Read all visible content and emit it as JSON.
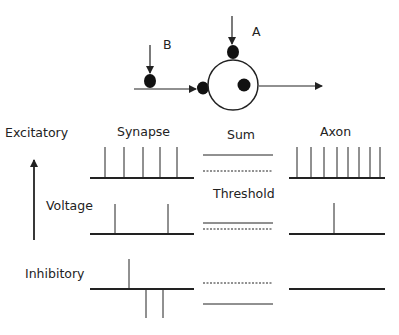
{
  "neuron": {
    "label_a": "A",
    "label_b": "B"
  },
  "labels": {
    "excitatory": "Excitatory",
    "voltage": "Voltage",
    "inhibitory": "Inhibitory",
    "synapse": "Synapse",
    "sum": "Sum",
    "axon": "Axon",
    "threshold": "Threshold"
  },
  "rows": [
    {
      "name": "excitatory",
      "synapse_spikes_up": 5,
      "synapse_spikes_down": 0,
      "sum_above_threshold": true,
      "axon_spikes": 8
    },
    {
      "name": "voltage",
      "synapse_spikes_up": 2,
      "synapse_spikes_down": 0,
      "sum_above_threshold": true,
      "axon_spikes": 1
    },
    {
      "name": "inhibitory",
      "synapse_spikes_up": 1,
      "synapse_spikes_down": 2,
      "sum_above_threshold": false,
      "axon_spikes": 0
    }
  ],
  "colors": {
    "ink": "#222222",
    "background": "#ffffff"
  }
}
